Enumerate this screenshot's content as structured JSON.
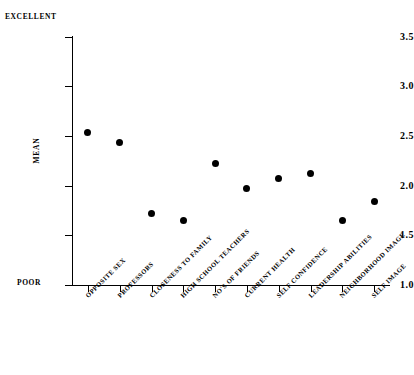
{
  "chart_data": {
    "type": "scatter",
    "title": "",
    "xlabel": "",
    "ylabel": "MEAN",
    "ylim": [
      1.0,
      3.5
    ],
    "ytick_labels": [
      "3.5",
      "3.0",
      "2.5",
      "2.0",
      "1.5",
      "1.0"
    ],
    "ytick_values": [
      3.5,
      3.0,
      2.5,
      2.0,
      1.5,
      1.0
    ],
    "grid": false,
    "legend": "none",
    "scale_high_label": "EXCELLENT",
    "scale_low_label": "POOR",
    "categories": [
      "OPPOSITE SEX",
      "PROFESSORS",
      "CLOSENESS TO FAMILY",
      "HIGH SCHOOL TEACHERS",
      "NO'S OF FRIENDS",
      "CURRENT HEALTH",
      "SELF CONFIDENCE",
      "LEADERSHIP ABILITIES",
      "NEIGHBORHOOD IMAGE",
      "SELF IMAGE"
    ],
    "values": [
      2.53,
      2.43,
      1.72,
      1.65,
      2.22,
      1.97,
      2.07,
      2.12,
      1.65,
      1.84
    ],
    "marker": "filled-circle",
    "marker_color": "#000000"
  }
}
